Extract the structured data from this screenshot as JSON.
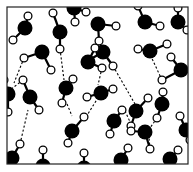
{
  "diagram": {
    "legend": {
      "oxygen_label": "O",
      "hydrogen_label": "H",
      "hbond_label": "hydrogen bond"
    },
    "colors": {
      "background": "#ffffff",
      "frame": "#222222",
      "oxygen": "#000000",
      "hydrogen_fill": "#ffffff",
      "hydrogen_stroke": "#000000",
      "bond": "#000000",
      "hbond": "#000000"
    },
    "frame": {
      "x": 7,
      "y": 7,
      "w": 181,
      "h": 157
    },
    "molecules": [
      {
        "o": [
          25,
          28
        ],
        "h": [
          [
            28,
            16
          ],
          [
            13,
            40
          ]
        ]
      },
      {
        "o": [
          42,
          52
        ],
        "h": [
          [
            24,
            58
          ],
          [
            51,
            70
          ]
        ]
      },
      {
        "o": [
          60,
          32
        ],
        "h": [
          [
            53,
            13
          ],
          [
            60,
            49
          ]
        ]
      },
      {
        "o": [
          74,
          8
        ],
        "h": [
          [
            86,
            12
          ],
          [
            75,
            22
          ]
        ]
      },
      {
        "o": [
          98,
          24
        ],
        "h": [
          [
            116,
            26
          ],
          [
            99,
            41
          ]
        ]
      },
      {
        "o": [
          145,
          22
        ],
        "h": [
          [
            160,
            26
          ],
          [
            138,
            6
          ]
        ]
      },
      {
        "o": [
          178,
          22
        ],
        "h": [
          [
            178,
            8
          ],
          [
            187,
            30
          ]
        ]
      },
      {
        "o": [
          103,
          52
        ],
        "h": [
          [
            113,
            66
          ],
          [
            89,
            60
          ]
        ]
      },
      {
        "o": [
          150,
          51
        ],
        "h": [
          [
            167,
            44
          ],
          [
            138,
            49
          ]
        ]
      },
      {
        "o": [
          181,
          70
        ],
        "h": [
          [
            171,
            57
          ],
          [
            162,
            80
          ]
        ]
      },
      {
        "o": [
          88,
          62
        ],
        "h": [
          [
            102,
            68
          ],
          [
            95,
            48
          ]
        ]
      },
      {
        "o": [
          66,
          88
        ],
        "h": [
          [
            73,
            79
          ],
          [
            62,
            103
          ]
        ]
      },
      {
        "o": [
          101,
          93
        ],
        "h": [
          [
            87,
            97
          ],
          [
            113,
            89
          ]
        ]
      },
      {
        "o": [
          30,
          97
        ],
        "h": [
          [
            23,
            80
          ],
          [
            39,
            110
          ]
        ]
      },
      {
        "o": [
          8,
          94
        ],
        "h": [
          [
            8,
            112
          ],
          [
            4,
            80
          ]
        ]
      },
      {
        "o": [
          136,
          111
        ],
        "h": [
          [
            148,
            98
          ],
          [
            131,
            126
          ]
        ]
      },
      {
        "o": [
          162,
          104
        ],
        "h": [
          [
            163,
            92
          ],
          [
            157,
            118
          ]
        ]
      },
      {
        "o": [
          186,
          130
        ],
        "h": [
          [
            180,
            116
          ],
          [
            190,
            140
          ]
        ]
      },
      {
        "o": [
          145,
          132
        ],
        "h": [
          [
            131,
            131
          ],
          [
            150,
            149
          ]
        ]
      },
      {
        "o": [
          72,
          131
        ],
        "h": [
          [
            84,
            117
          ],
          [
            68,
            143
          ]
        ]
      },
      {
        "o": [
          114,
          121
        ],
        "h": [
          [
            110,
            134
          ],
          [
            122,
            110
          ]
        ]
      },
      {
        "o": [
          12,
          158
        ],
        "h": [
          [
            20,
            144
          ]
        ]
      },
      {
        "o": [
          121,
          160
        ],
        "h": [
          [
            128,
            148
          ]
        ]
      },
      {
        "o": [
          170,
          159
        ],
        "h": [
          [
            178,
            150
          ]
        ]
      },
      {
        "o": [
          43,
          166
        ],
        "h": [
          [
            43,
            150
          ]
        ]
      },
      {
        "o": [
          84,
          168
        ],
        "h": [
          [
            84,
            153
          ]
        ]
      }
    ],
    "hbonds": [
      [
        [
          67,
          104
        ],
        [
          72,
          116
        ]
      ],
      [
        [
          60,
          49
        ],
        [
          64,
          80
        ]
      ],
      [
        [
          24,
          58
        ],
        [
          14,
          83
        ]
      ],
      [
        [
          113,
          66
        ],
        [
          135,
          104
        ]
      ],
      [
        [
          102,
          68
        ],
        [
          98,
          85
        ]
      ],
      [
        [
          23,
          80
        ],
        [
          10,
          90
        ]
      ],
      [
        [
          162,
          80
        ],
        [
          148,
          50
        ]
      ],
      [
        [
          150,
          149
        ],
        [
          148,
          125
        ]
      ],
      [
        [
          20,
          144
        ],
        [
          28,
          110
        ]
      ],
      [
        [
          86,
          117
        ],
        [
          101,
          93
        ]
      ],
      [
        [
          125,
          111
        ],
        [
          131,
          124
        ]
      ],
      [
        [
          99,
          41
        ],
        [
          98,
          50
        ]
      ],
      [
        [
          157,
          118
        ],
        [
          150,
          128
        ]
      ]
    ]
  }
}
